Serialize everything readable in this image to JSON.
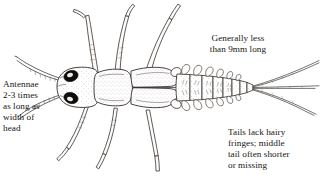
{
  "figure": {
    "background_color": "#ffffff",
    "ink_color": "#1a1614"
  },
  "captions": {
    "antennae": "Antennae\n2-3 times\nas long as\nwidth of\nhead",
    "length": "Generally less\nthan 9mm long",
    "tails": "Tails lack hairy\nfringes; middle\ntail often shorter\nor missing"
  },
  "anatomy": {
    "head_label": "head",
    "eyes_count": 2,
    "antennae_count": 2,
    "legs_count": 6,
    "tail_filaments": 3,
    "abdomen_segments": 8,
    "wing_pads": 2
  }
}
